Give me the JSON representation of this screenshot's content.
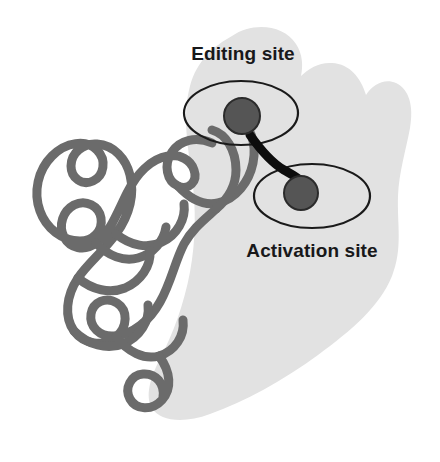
{
  "figure": {
    "background_color": "#ffffff",
    "width": 440,
    "height": 462
  },
  "enzyme_body": {
    "name": "enzyme-blob",
    "fill_color": "#e2e2e2"
  },
  "backbone": {
    "name": "protein-backbone-ribbon",
    "stroke_color": "#6b6b6b",
    "stroke_width": 9
  },
  "connector": {
    "name": "site-connector",
    "stroke_color": "#0d0d0d",
    "stroke_width": 9
  },
  "sites": [
    {
      "id": "editing",
      "label": "Editing site",
      "label_position": "above",
      "ellipse_stroke_color": "#1a1a1a",
      "marker_fill_color": "#555555",
      "marker_stroke_color": "#2b2b2b"
    },
    {
      "id": "activation",
      "label": "Activation site",
      "label_position": "below",
      "ellipse_stroke_color": "#1a1a1a",
      "marker_fill_color": "#555555",
      "marker_stroke_color": "#2b2b2b"
    }
  ]
}
